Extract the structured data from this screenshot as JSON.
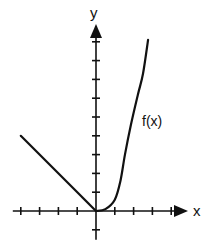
{
  "chart_data": {
    "type": "line",
    "title": "",
    "xlabel": "x",
    "ylabel": "y",
    "xlim": [
      -4,
      4
    ],
    "ylim": [
      -1,
      9
    ],
    "x_ticks": [
      -4,
      -3,
      -2,
      -1,
      1,
      2,
      3,
      4
    ],
    "y_ticks": [
      -1,
      1,
      2,
      3,
      4,
      5,
      6,
      7,
      8,
      9
    ],
    "tick_labels_shown": false,
    "grid": false,
    "legend": null,
    "series": [
      {
        "name": "f(x)",
        "label": "f(x)",
        "piecewise": [
          {
            "description": "linear, f(x) = -x for x < 0",
            "points": [
              [
                -4,
                4
              ],
              [
                0,
                0
              ]
            ]
          },
          {
            "description": "increasing curve for x >= 0",
            "points": [
              [
                0,
                0
              ],
              [
                0.5,
                0.1
              ],
              [
                1.0,
                0.6
              ],
              [
                1.3,
                1.6
              ],
              [
                1.54,
                3.0
              ],
              [
                1.86,
                4.6
              ],
              [
                2.23,
                6.2
              ],
              [
                2.5,
                7.3
              ],
              [
                2.77,
                9.1
              ]
            ]
          }
        ]
      }
    ],
    "annotations": [
      {
        "text": "f(x)",
        "near": [
          2.45,
          4.5
        ]
      }
    ]
  }
}
